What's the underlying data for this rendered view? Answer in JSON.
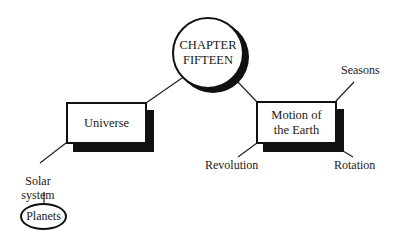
{
  "diagram": {
    "central": {
      "line1": "CHAPTER",
      "line2": "FIFTEEN"
    },
    "branches": [
      {
        "label": "Universe",
        "children": [
          {
            "label_line1": "Solar",
            "label_line2": "system",
            "children": [
              {
                "label": "Planets"
              }
            ]
          }
        ]
      },
      {
        "label_line1": "Motion of",
        "label_line2": "the Earth",
        "children": [
          {
            "label": "Seasons"
          },
          {
            "label": "Revolution"
          },
          {
            "label": "Rotation"
          }
        ]
      }
    ]
  },
  "colors": {
    "ink": "#111111",
    "background": "#ffffff"
  }
}
